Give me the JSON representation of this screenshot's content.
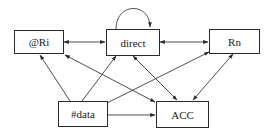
{
  "diagram": {
    "type": "directed-graph",
    "nodes": [
      {
        "id": "ri",
        "label": "@Ri"
      },
      {
        "id": "direct",
        "label": "direct"
      },
      {
        "id": "rn",
        "label": "Rn"
      },
      {
        "id": "data",
        "label": "#data"
      },
      {
        "id": "acc",
        "label": "ACC"
      }
    ],
    "edges": [
      {
        "from": "direct",
        "to": "direct",
        "kind": "self-loop"
      },
      {
        "from": "ri",
        "to": "direct",
        "kind": "bidirectional"
      },
      {
        "from": "direct",
        "to": "rn",
        "kind": "bidirectional"
      },
      {
        "from": "data",
        "to": "ri",
        "kind": "directed"
      },
      {
        "from": "data",
        "to": "direct",
        "kind": "directed"
      },
      {
        "from": "data",
        "to": "rn",
        "kind": "directed"
      },
      {
        "from": "data",
        "to": "acc",
        "kind": "directed"
      },
      {
        "from": "ri",
        "to": "acc",
        "kind": "bidirectional"
      },
      {
        "from": "direct",
        "to": "acc",
        "kind": "bidirectional"
      },
      {
        "from": "rn",
        "to": "acc",
        "kind": "bidirectional"
      }
    ],
    "colors": {
      "stroke": "#2a2a2a",
      "background": "#ffffff",
      "text": "#222222"
    }
  }
}
